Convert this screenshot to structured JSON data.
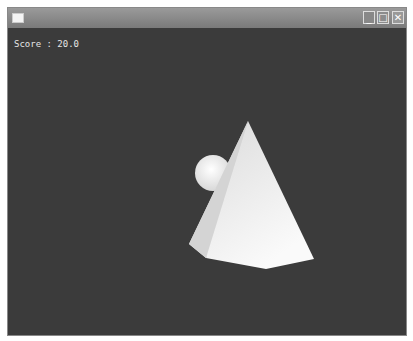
{
  "window": {
    "title": "",
    "controls": {
      "minimize": "_",
      "maximize": "□",
      "close": "✕"
    }
  },
  "hud": {
    "score_label": "Score",
    "score_separator": ":",
    "score_value": "20.0"
  },
  "scene": {
    "background": "#3b3b3b",
    "objects": [
      {
        "type": "pyramid",
        "color": "#e8e8e8"
      },
      {
        "type": "sphere",
        "color": "#f2f2f2"
      }
    ]
  }
}
